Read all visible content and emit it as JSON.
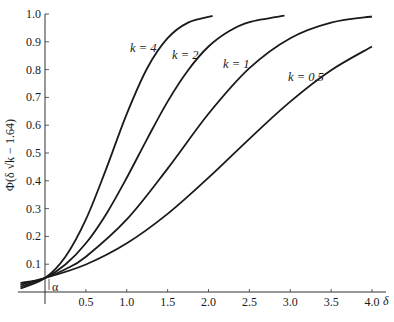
{
  "chart_data": {
    "type": "line",
    "title": "",
    "xlabel": "δ",
    "ylabel": "Φ(δ√k − 1.64)",
    "xlim": [
      -0.33,
      4.2
    ],
    "ylim": [
      0,
      1.0
    ],
    "grid": false,
    "legend": "inline labels on curves",
    "x_ticks": [
      0.5,
      1.0,
      1.5,
      2.0,
      2.5,
      3.0,
      3.5,
      4.0
    ],
    "x_tick_labels": [
      "0.5",
      "1.0",
      "1.5",
      "2.0",
      "2.5",
      "3.0",
      "3.5",
      "4.0"
    ],
    "y_ticks": [
      0.1,
      0.2,
      0.3,
      0.4,
      0.5,
      0.6,
      0.7,
      0.8,
      0.9,
      1.0
    ],
    "y_tick_labels": [
      "0.1",
      "0.2",
      "0.3",
      "0.4",
      "0.5",
      "0.6",
      "0.7",
      "0.8",
      "0.9",
      "1.0"
    ],
    "annotations": [
      {
        "text": "α",
        "x": 0.05,
        "y": 0.025,
        "note": "bracket marking α = 0.05 at δ = 0"
      }
    ],
    "series": [
      {
        "name": "k = 4",
        "k": 4,
        "x": [
          -0.3,
          0,
          0.25,
          0.5,
          0.75,
          1.0,
          1.25,
          1.5,
          1.75,
          2.05
        ],
        "values": [
          0.0125,
          0.0505,
          0.127,
          0.261,
          0.444,
          0.641,
          0.805,
          0.913,
          0.969,
          0.993
        ]
      },
      {
        "name": "k = 2",
        "k": 2,
        "x": [
          -0.3,
          0,
          0.25,
          0.5,
          0.75,
          1.0,
          1.25,
          1.5,
          1.75,
          2.0,
          2.25,
          2.5,
          2.93
        ],
        "values": [
          0.0195,
          0.0505,
          0.099,
          0.175,
          0.281,
          0.411,
          0.551,
          0.685,
          0.798,
          0.883,
          0.938,
          0.971,
          0.994
        ]
      },
      {
        "name": "k = 1",
        "k": 1,
        "x": [
          -0.3,
          0,
          0.25,
          0.5,
          1.0,
          1.5,
          2.0,
          2.5,
          3.0,
          3.5,
          4.0
        ],
        "values": [
          0.026,
          0.0505,
          0.082,
          0.127,
          0.261,
          0.444,
          0.641,
          0.805,
          0.913,
          0.969,
          0.991
        ]
      },
      {
        "name": "k = 0.5",
        "k": 0.5,
        "x": [
          -0.3,
          0,
          0.5,
          1.0,
          1.5,
          2.0,
          2.5,
          3.0,
          3.5,
          4.0
        ],
        "values": [
          0.032,
          0.0505,
          0.099,
          0.175,
          0.281,
          0.411,
          0.551,
          0.685,
          0.798,
          0.883
        ]
      }
    ]
  },
  "labels": {
    "k4": "k = 4",
    "k2": "k = 2",
    "k1": "k = 1",
    "k05": "k = 0.5",
    "alpha": "α",
    "x_axis": "δ",
    "y_axis": "Φ(δ √k − 1.64)"
  },
  "style": {
    "line_color": "#1a1a1a",
    "axis_color": "#333333"
  }
}
